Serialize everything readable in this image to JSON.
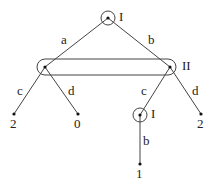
{
  "diagram": {
    "type": "extensive-form game tree",
    "colors": {
      "line": "#444444",
      "node": "#111111",
      "background": "#ffffff"
    },
    "nodes": {
      "root": {
        "player": "I",
        "x": 108,
        "y": 18,
        "circled": true
      },
      "left": {
        "x": 45,
        "y": 67
      },
      "right": {
        "x": 170,
        "y": 67
      },
      "inner": {
        "player": "I",
        "x": 140,
        "y": 115,
        "circled": true
      },
      "leaf_left_c": {
        "payoff": "2",
        "x": 14,
        "y": 114
      },
      "leaf_left_d": {
        "payoff": "0",
        "x": 78,
        "y": 114
      },
      "leaf_right_d": {
        "payoff": "2",
        "x": 201,
        "y": 114
      },
      "leaf_inner_b": {
        "payoff": "1",
        "x": 140,
        "y": 164
      }
    },
    "info_set": {
      "player": "II"
    },
    "edges": {
      "root_a": "a",
      "root_b": "b",
      "left_c": "c",
      "left_d": "d",
      "right_c": "c",
      "right_d": "d",
      "inner_b": "b"
    }
  }
}
